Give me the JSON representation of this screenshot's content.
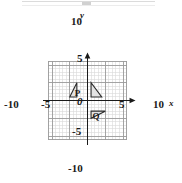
{
  "chart_data": {
    "type": "scatter",
    "title": "",
    "xlabel": "x",
    "ylabel": "y",
    "xlim": [
      -11,
      11
    ],
    "ylim": [
      -11,
      11
    ],
    "grid": true,
    "minor_grid_step": 1,
    "major_grid_step": 5,
    "legend": "none",
    "x_tick_labels": [
      "-10",
      "-5",
      "0",
      "5",
      "10"
    ],
    "x_tick_values": [
      -10,
      -5,
      0,
      5,
      10
    ],
    "y_tick_labels": [
      "10",
      "5",
      "-5",
      "-10"
    ],
    "y_tick_values": [
      10,
      5,
      -5,
      -10
    ],
    "origin_label": "0",
    "shapes": [
      {
        "name": "triangle-p",
        "label": "P",
        "label_point": [
          -3.6,
          2.2
        ],
        "vertices": [
          [
            -3,
            5
          ],
          [
            -5,
            1
          ],
          [
            -3,
            1
          ]
        ],
        "fill": "#e3e3e3",
        "stroke": "#2b2b2b"
      },
      {
        "name": "triangle-unlabeled",
        "label": "",
        "label_point": [
          0,
          0
        ],
        "vertices": [
          [
            1,
            5
          ],
          [
            1,
            1
          ],
          [
            4,
            1
          ]
        ],
        "fill": "#e3e3e3",
        "stroke": "#2b2b2b"
      },
      {
        "name": "triangle-q",
        "label": "Q",
        "label_point": [
          1.4,
          -4.4
        ],
        "vertices": [
          [
            1,
            -3
          ],
          [
            1,
            -5
          ],
          [
            5,
            -3
          ]
        ],
        "fill": "#e3e3e3",
        "stroke": "#2b2b2b"
      }
    ],
    "colors": {
      "axis": "#1a1a1a",
      "major_grid": "#9a9a9a",
      "minor_grid": "#d8d8d8",
      "shape_fill": "#e3e3e3",
      "shape_stroke": "#2b2b2b",
      "background": "#ffffff"
    }
  },
  "labels": {
    "x_neg10": "-10",
    "x_neg5": "-5",
    "x_pos5": "5",
    "x_pos10": "10",
    "y_pos10": "10",
    "y_pos5": "5",
    "y_neg5": "-5",
    "y_neg10": "-10",
    "origin": "0",
    "axis_x": "x",
    "axis_y": "y",
    "shape_p": "P",
    "shape_q": "Q"
  }
}
